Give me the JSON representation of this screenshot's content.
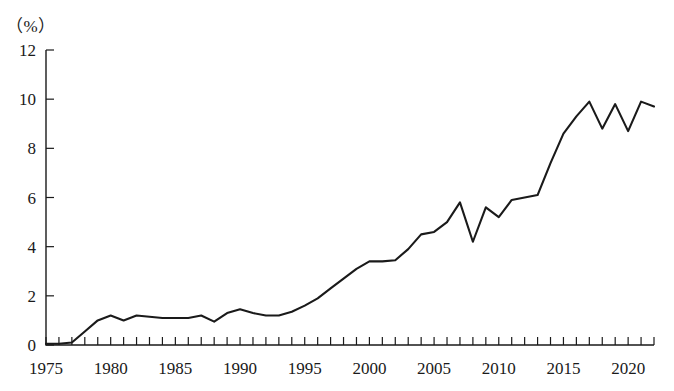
{
  "chart_data": {
    "type": "line",
    "title": "",
    "subtitle": "",
    "unit_label": "（%）",
    "xlabel": "",
    "ylabel": "",
    "xlim": [
      1975,
      2022
    ],
    "ylim": [
      0,
      12
    ],
    "y_ticks": [
      0,
      2,
      4,
      6,
      8,
      10,
      12
    ],
    "y_tick_labels": [
      "0",
      "2",
      "4",
      "6",
      "8",
      "10",
      "12"
    ],
    "x_tick_labels": [
      "1975",
      "1980",
      "1985",
      "1990",
      "1995",
      "2000",
      "2005",
      "2010",
      "2015",
      "2020"
    ],
    "x_tick_label_years": [
      1975,
      1980,
      1985,
      1990,
      1995,
      2000,
      2005,
      2010,
      2015,
      2020
    ],
    "x_minor_tick_interval": 1,
    "grid": false,
    "legend": null,
    "legend_position": "none",
    "annotations": [],
    "line_color": "#1a1a1a",
    "x": [
      1975,
      1976,
      1977,
      1978,
      1979,
      1980,
      1981,
      1982,
      1983,
      1984,
      1985,
      1986,
      1987,
      1988,
      1989,
      1990,
      1991,
      1992,
      1993,
      1994,
      1995,
      1996,
      1997,
      1998,
      1999,
      2000,
      2001,
      2002,
      2003,
      2004,
      2005,
      2006,
      2007,
      2008,
      2009,
      2010,
      2011,
      2012,
      2013,
      2014,
      2015,
      2016,
      2017,
      2018,
      2019,
      2020,
      2021,
      2022
    ],
    "series": [
      {
        "name": "value",
        "values": [
          0.05,
          0.05,
          0.1,
          0.55,
          1.0,
          1.2,
          1.0,
          1.2,
          1.15,
          1.1,
          1.1,
          1.1,
          1.2,
          0.95,
          1.3,
          1.45,
          1.3,
          1.2,
          1.2,
          1.35,
          1.6,
          1.9,
          2.3,
          2.7,
          3.1,
          3.4,
          3.4,
          3.45,
          3.9,
          4.5,
          4.6,
          5.0,
          5.8,
          4.2,
          5.6,
          5.2,
          5.9,
          6.0,
          6.1,
          7.4,
          8.6,
          9.3,
          9.9,
          8.8,
          9.8,
          8.7,
          9.9,
          9.7
        ]
      }
    ]
  }
}
